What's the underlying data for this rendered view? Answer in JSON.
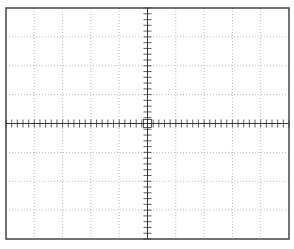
{
  "graticule": {
    "type": "oscilloscope-graticule",
    "horizontal_divisions": 10,
    "vertical_divisions": 8,
    "minor_ticks_per_division": 5,
    "frame": {
      "x": 6,
      "y": 8,
      "width": 283,
      "height": 231
    },
    "colors": {
      "frame": "#444444",
      "grid": "#b8b8b8",
      "axis": "#333333"
    }
  }
}
